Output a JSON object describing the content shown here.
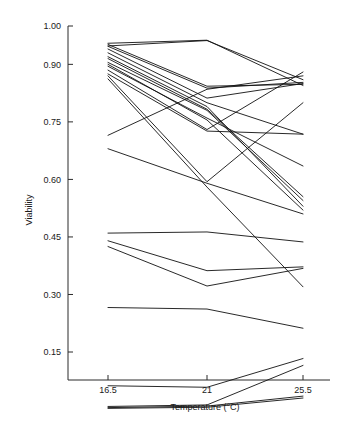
{
  "chart_data": {
    "type": "line",
    "title": "",
    "subtitle": "",
    "xlabel": "Temperature (°C)",
    "ylabel": "Viability",
    "x": [
      16.5,
      21,
      25.5
    ],
    "x_tick_labels": [
      "16.5",
      "21",
      "25.5"
    ],
    "y_ticks": [
      1.0,
      0.9,
      0.75,
      0.6,
      0.45,
      0.3,
      0.15
    ],
    "y_tick_labels": [
      "1.00",
      "0.90",
      "0.75",
      "0.60",
      "0.45",
      "0.30",
      "0.15"
    ],
    "ylim": [
      0.0,
      1.0
    ],
    "xlim": [
      15.4,
      26.6
    ],
    "grid": false,
    "legend": "none",
    "line_color": "#111111",
    "marker": "none",
    "annotations": [],
    "series": [
      {
        "name": "s1",
        "values": [
          0.955,
          0.963,
          0.845
        ]
      },
      {
        "name": "s2",
        "values": [
          0.948,
          0.962,
          0.86
        ]
      },
      {
        "name": "s3",
        "values": [
          0.952,
          0.843,
          0.848
        ]
      },
      {
        "name": "s4",
        "values": [
          0.947,
          0.838,
          0.853
        ]
      },
      {
        "name": "s5",
        "values": [
          0.94,
          0.812,
          0.85
        ]
      },
      {
        "name": "s6",
        "values": [
          0.93,
          0.8,
          0.718
        ]
      },
      {
        "name": "s7",
        "values": [
          0.92,
          0.79,
          0.53
        ]
      },
      {
        "name": "s8",
        "values": [
          0.915,
          0.783,
          0.555
        ]
      },
      {
        "name": "s9",
        "values": [
          0.905,
          0.78,
          0.545
        ]
      },
      {
        "name": "s10",
        "values": [
          0.9,
          0.755,
          0.52
        ]
      },
      {
        "name": "s11",
        "values": [
          0.895,
          0.76,
          0.635
        ]
      },
      {
        "name": "s12",
        "values": [
          0.885,
          0.73,
          0.88
        ]
      },
      {
        "name": "s13",
        "values": [
          0.875,
          0.726,
          0.718
        ]
      },
      {
        "name": "s14",
        "values": [
          0.87,
          0.594,
          0.8
        ]
      },
      {
        "name": "s15",
        "values": [
          0.862,
          0.58,
          0.32
        ]
      },
      {
        "name": "s16",
        "values": [
          0.715,
          0.835,
          0.87
        ]
      },
      {
        "name": "s17",
        "values": [
          0.68,
          0.59,
          0.51
        ]
      },
      {
        "name": "s18",
        "values": [
          0.46,
          0.463,
          0.437
        ]
      },
      {
        "name": "s19",
        "values": [
          0.44,
          0.362,
          0.372
        ]
      },
      {
        "name": "s20",
        "values": [
          0.425,
          0.322,
          0.368
        ]
      },
      {
        "name": "s21",
        "values": [
          0.266,
          0.262,
          0.212
        ]
      },
      {
        "name": "s22",
        "values": [
          0.062,
          0.058,
          0.133
        ]
      },
      {
        "name": "s23",
        "values": [
          0.008,
          0.012,
          0.115
        ]
      },
      {
        "name": "s24",
        "values": [
          0.005,
          0.009,
          0.035
        ]
      },
      {
        "name": "s25",
        "values": [
          0.003,
          0.006,
          0.03
        ]
      }
    ]
  },
  "layout": {
    "plot_left": 68,
    "plot_right": 330,
    "plot_top": 26,
    "plot_bottom": 380,
    "x_pixels": [
      108,
      207,
      303
    ],
    "y_value_top": 1.0,
    "y_pixel_top": 26,
    "y_value_bottom_ref": 0.15,
    "y_pixel_bottom_ref": 352
  }
}
